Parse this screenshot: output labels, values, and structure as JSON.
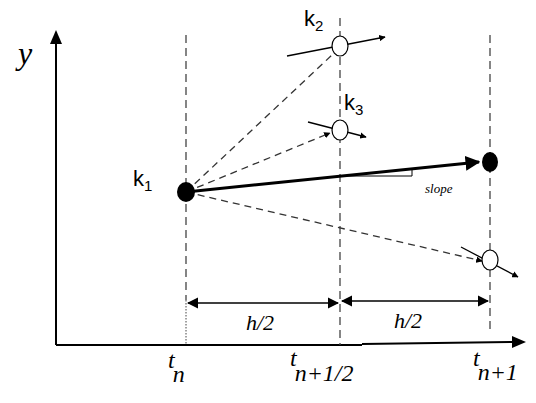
{
  "diagram": {
    "axes": {
      "y_label": "y",
      "x_ticks": [
        {
          "base": "t",
          "sub": "n"
        },
        {
          "base": "t",
          "sub": "n+1/2"
        },
        {
          "base": "t",
          "sub": "n+1"
        }
      ]
    },
    "intervals": [
      {
        "label": "h/2"
      },
      {
        "label": "h/2"
      }
    ],
    "slopes": [
      {
        "label": "k",
        "sub": "1"
      },
      {
        "label": "k",
        "sub": "2"
      },
      {
        "label": "k",
        "sub": "3"
      }
    ],
    "annotation": "slope",
    "colors": {
      "line": "#000000",
      "dashed": "#333333",
      "background": "#ffffff"
    }
  }
}
